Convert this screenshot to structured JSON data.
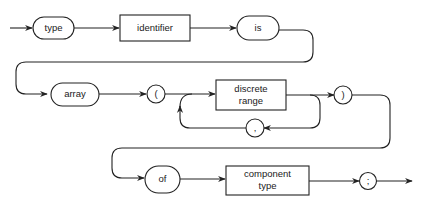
{
  "diagram": {
    "type": "syntax-railroad",
    "colors": {
      "stroke": "#222222",
      "background": "#ffffff",
      "text": "#1a1a1a"
    },
    "rows": [
      {
        "nodes": [
          {
            "id": "type",
            "kind": "terminal",
            "label": "type"
          },
          {
            "id": "identifier",
            "kind": "nonterminal",
            "label": "identifier"
          },
          {
            "id": "is",
            "kind": "terminal",
            "label": "is"
          }
        ]
      },
      {
        "nodes": [
          {
            "id": "array",
            "kind": "terminal",
            "label": "array"
          },
          {
            "id": "lparen",
            "kind": "terminal",
            "label": "("
          },
          {
            "id": "discrete_range",
            "kind": "nonterminal",
            "label_line1": "discrete",
            "label_line2": "range"
          },
          {
            "id": "rparen",
            "kind": "terminal",
            "label": ")"
          },
          {
            "id": "comma",
            "kind": "terminal",
            "label": ",",
            "role": "repeat-loop"
          }
        ]
      },
      {
        "nodes": [
          {
            "id": "of",
            "kind": "terminal",
            "label": "of"
          },
          {
            "id": "component_type",
            "kind": "nonterminal",
            "label_line1": "component",
            "label_line2": "type"
          },
          {
            "id": "semicolon",
            "kind": "terminal",
            "label": ";"
          }
        ]
      }
    ]
  }
}
